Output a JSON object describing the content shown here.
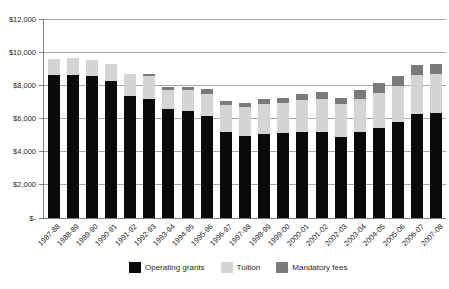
{
  "chart_data": {
    "type": "bar",
    "stacked": true,
    "title": "",
    "xlabel": "",
    "ylabel": "",
    "ylim": [
      0,
      12000
    ],
    "y_tick_interval": 2000,
    "y_tick_labels": [
      "$-",
      "$2,000",
      "$4,000",
      "$6,000",
      "$8,000",
      "$10,000",
      "$12,000"
    ],
    "grid": true,
    "legend_position": "bottom",
    "categories": [
      "1987-88",
      "1988-89",
      "1989-90",
      "1990-91",
      "1991-92",
      "1992-93",
      "1993-94",
      "1994-95",
      "1995-96",
      "1996-97",
      "1997-98",
      "1998-99",
      "1999-00",
      "2000-01",
      "2001-02",
      "2002-03",
      "2003-04",
      "2004-05",
      "2005-06",
      "2006-07",
      "2007-08"
    ],
    "series": [
      {
        "name": "Operating grants",
        "color": "#0a0a0a",
        "values": [
          8600,
          8600,
          8550,
          8250,
          7350,
          7200,
          6600,
          6450,
          6150,
          5200,
          4950,
          5050,
          5150,
          5200,
          5200,
          4900,
          5200,
          5400,
          5800,
          6300,
          6350
        ]
      },
      {
        "name": "Tuition",
        "color": "#d4d4d4",
        "values": [
          1000,
          1050,
          1000,
          1050,
          1350,
          1350,
          1150,
          1300,
          1350,
          1600,
          1750,
          1800,
          1800,
          1900,
          2000,
          1950,
          2000,
          2150,
          2150,
          2300,
          2350
        ]
      },
      {
        "name": "Mandatory fees",
        "color": "#7a7a7a",
        "values": [
          0,
          0,
          0,
          0,
          0,
          150,
          150,
          150,
          300,
          250,
          250,
          300,
          300,
          350,
          400,
          400,
          500,
          600,
          600,
          600,
          600
        ]
      }
    ],
    "axis_color": "#7f7f7f",
    "gridline_color": "#a6a6a6"
  }
}
